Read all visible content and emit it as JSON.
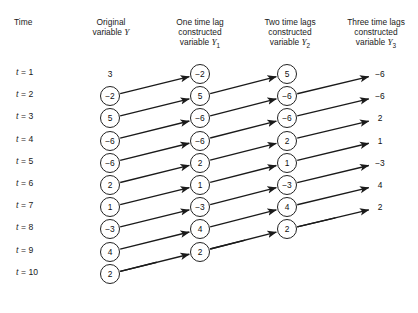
{
  "figure": {
    "background_color": "#ffffff",
    "line_color": "#1a1a1a",
    "headers": {
      "time": "Time",
      "original": "Original\nvariable ",
      "original_var": "Y",
      "lag1": "One time lag\nconstructed\nvariable ",
      "lag1_var": "Y",
      "lag1_sub": "1",
      "lag2": "Two time lags\nconstructed\nvariable ",
      "lag2_var": "Y",
      "lag2_sub": "2",
      "lag3": "Three time lags\nconstructed\nvariable ",
      "lag3_var": "Y",
      "lag3_sub": "3"
    },
    "time_prefix": "t",
    "time_equals": " = ",
    "rows": [
      {
        "time": "1"
      },
      {
        "time": "2"
      },
      {
        "time": "3"
      },
      {
        "time": "4"
      },
      {
        "time": "5"
      },
      {
        "time": "6"
      },
      {
        "time": "7"
      },
      {
        "time": "8"
      },
      {
        "time": "9"
      },
      {
        "time": "10"
      }
    ],
    "columns": {
      "y": {
        "label": "Y",
        "circled": false,
        "values": [
          "3",
          "−2",
          "5",
          "−6",
          "−6",
          "2",
          "1",
          "−3",
          "4",
          "2"
        ]
      },
      "y1": {
        "label": "Y1",
        "circled": true,
        "values": [
          "−2",
          "5",
          "−6",
          "−6",
          "2",
          "1",
          "−3",
          "4",
          "2"
        ]
      },
      "y2": {
        "label": "Y2",
        "circled": true,
        "values": [
          "5",
          "−6",
          "−6",
          "2",
          "1",
          "−3",
          "4",
          "2"
        ]
      },
      "y3": {
        "label": "Y3",
        "circled": false,
        "values": [
          "−6",
          "−6",
          "2",
          "1",
          "−3",
          "4",
          "2"
        ]
      }
    }
  },
  "chart_data": {
    "type": "table",
    "categories": [
      "t = 1",
      "t = 2",
      "t = 3",
      "t = 4",
      "t = 5",
      "t = 6",
      "t = 7",
      "t = 8",
      "t = 9",
      "t = 10"
    ],
    "series": [
      {
        "name": "Original variable Y",
        "values": [
          3,
          -2,
          5,
          -6,
          -6,
          2,
          1,
          -3,
          4,
          2
        ]
      },
      {
        "name": "One time lag constructed Y1",
        "values": [
          -2,
          5,
          -6,
          -6,
          2,
          1,
          -3,
          4,
          2,
          null
        ]
      },
      {
        "name": "Two time lags constructed Y2",
        "values": [
          5,
          -6,
          -6,
          2,
          1,
          -3,
          4,
          2,
          null,
          null
        ]
      },
      {
        "name": "Three time lags constructed Y3",
        "values": [
          -6,
          -6,
          2,
          1,
          -3,
          4,
          2,
          null,
          null,
          null
        ]
      }
    ],
    "xlabel": "Time",
    "ylabel": "",
    "grid": false,
    "legend": "none"
  }
}
